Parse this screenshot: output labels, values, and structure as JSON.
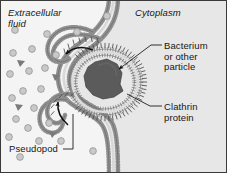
{
  "figure": {
    "background_color": "#f2f2f2",
    "border_color": "#3a3a3a",
    "width": 227,
    "height": 173
  },
  "labels": {
    "extracellular_fluid": "Extracellular\nfluid",
    "cytoplasm": "Cytoplasm",
    "bacterium": "Bacterium\nor other\nparticle",
    "clathrin": "Clathrin\nprotein",
    "pseudopod": "Pseudopod"
  },
  "colors": {
    "text": "#161616",
    "membrane_line": "#6e6e6e",
    "membrane_head": "#9a9a9a",
    "clathrin_bristle": "#4a4a4a",
    "particle_fill": "#c9c9c9",
    "particle_stroke": "#8e8e8e",
    "triangle_fill": "#7a7a7a",
    "bacterium_fill": "#5a5a5a",
    "arrow": "#101010",
    "leader_line": "#202020",
    "cytoplasm_shade": "#e4e4e4"
  },
  "elements": {
    "membrane_description": "phospholipid bilayer drawn as two beaded rows invaginating to engulf a particle",
    "clathrin_description": "short radial bristles on the cytoplasmic face of the invaginating membrane",
    "bacterium_description": "dark irregular polygon inside the forming vesicle",
    "arrows": [
      {
        "name": "upper-pseudopod-arrow",
        "direction": "leftward-curved"
      },
      {
        "name": "lower-pseudopod-arrow",
        "direction": "upward-left-curved"
      }
    ],
    "extracellular_particles": {
      "circles": 22,
      "triangles": 4
    }
  }
}
